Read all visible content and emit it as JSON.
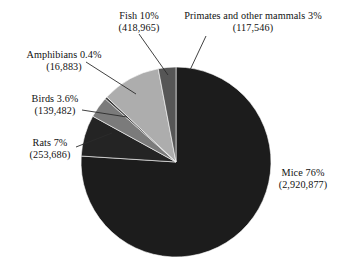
{
  "chart_data": {
    "type": "pie",
    "title": "",
    "subtitle": "",
    "xlabel": "",
    "ylabel": "",
    "legend_position": "none",
    "grid": false,
    "start_angle_deg": 0,
    "direction": "clockwise",
    "total": 3867439,
    "categories": [
      "Mice",
      "Rats",
      "Birds",
      "Amphibians",
      "Fish",
      "Primates and other mammals"
    ],
    "values": [
      76,
      7,
      3.6,
      0.4,
      10,
      3
    ],
    "counts": [
      2920877,
      253686,
      139482,
      16883,
      418965,
      117546
    ],
    "colors": [
      "#1c1c1c",
      "#242424",
      "#7b7b7b",
      "#3f3f3f",
      "#adadad",
      "#565656"
    ],
    "slices": [
      {
        "name": "Mice",
        "percent": 76,
        "count": 2920877,
        "color": "#1c1c1c",
        "label_line1": "Mice 76%",
        "label_line2": "(2,920,877)"
      },
      {
        "name": "Rats",
        "percent": 7,
        "count": 253686,
        "color": "#242424",
        "label_line1": "Rats 7%",
        "label_line2": "(253,686)"
      },
      {
        "name": "Birds",
        "percent": 3.6,
        "count": 139482,
        "color": "#7b7b7b",
        "label_line1": "Birds 3.6%",
        "label_line2": "(139,482)"
      },
      {
        "name": "Amphibians",
        "percent": 0.4,
        "count": 16883,
        "color": "#3f3f3f",
        "label_line1": "Amphibians 0.4%",
        "label_line2": "(16,883)"
      },
      {
        "name": "Fish",
        "percent": 10,
        "count": 418965,
        "color": "#adadad",
        "label_line1": "Fish 10%",
        "label_line2": "(418,965)"
      },
      {
        "name": "Primates and other mammals",
        "percent": 3,
        "count": 117546,
        "color": "#565656",
        "label_line1": "Primates and other mammals 3%",
        "label_line2": "(117,546)"
      }
    ]
  },
  "labels": {
    "fish": {
      "line1": "Fish 10%",
      "line2": "(418,965)"
    },
    "primates": {
      "line1": "Primates and other mammals 3%",
      "line2": "(117,546)"
    },
    "amphibians": {
      "line1": "Amphibians 0.4%",
      "line2": "(16,883)"
    },
    "birds": {
      "line1": "Birds 3.6%",
      "line2": "(139,482)"
    },
    "rats": {
      "line1": "Rats 7%",
      "line2": "(253,686)"
    },
    "mice": {
      "line1": "Mice 76%",
      "line2": "(2,920,877)"
    }
  }
}
